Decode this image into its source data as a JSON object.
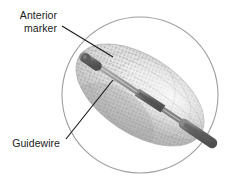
{
  "figure": {
    "kind": "medical-illustration",
    "background_color": "#ffffff",
    "outline_color": "#9a9a9a",
    "leader_line_color": "#1a1a1a",
    "mesh_fill_light": "#e3e3e3",
    "mesh_fill_mid": "#c3c3c3",
    "mesh_fill_dark": "#a6a6a6",
    "guidewire_color": "#9b9b9b",
    "marker_dark_color": "#6e6e6e",
    "marker_darkest_color": "#5a5a5a"
  },
  "labels": {
    "anterior_marker": {
      "line1": "Anterior",
      "line2": "marker"
    },
    "guidewire": {
      "line1": "Guidewire"
    }
  },
  "callouts": {
    "anterior_marker_leader": {
      "from_x": 62,
      "from_y": 26,
      "to_x": 113,
      "to_y": 57
    },
    "guidewire_leader": {
      "from_x": 66,
      "from_y": 139,
      "to_x": 113,
      "to_y": 80
    }
  },
  "geometry": {
    "vessel_circle": {
      "cx": 140,
      "cy": 95,
      "r": 78
    },
    "device_ellipse": {
      "cx": 140,
      "cy": 95,
      "rx": 72,
      "ry": 39,
      "rotation_deg": 33
    },
    "guidewire_axis": {
      "x1": 80,
      "y1": 55,
      "x2": 200,
      "y2": 135
    }
  }
}
